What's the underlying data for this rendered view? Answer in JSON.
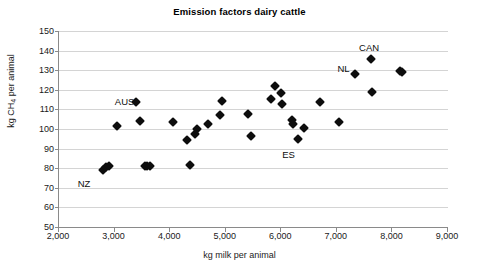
{
  "chart_data": {
    "type": "scatter",
    "title": "Emission factors dairy cattle",
    "xlabel": "kg milk per animal",
    "ylabel": "kg CH4 per animal",
    "ylabel_parts": {
      "prefix": "kg CH",
      "subscript": "4",
      "suffix": " per animal"
    },
    "xlim": [
      2000,
      9000
    ],
    "ylim": [
      50,
      150
    ],
    "xticks": [
      2000,
      3000,
      4000,
      5000,
      6000,
      7000,
      8000,
      9000
    ],
    "xtick_labels": [
      "2,000",
      "3,000",
      "4,000",
      "5,000",
      "6,000",
      "7,000",
      "8,000",
      "9,000"
    ],
    "yticks": [
      50,
      60,
      70,
      80,
      90,
      100,
      110,
      120,
      130,
      140,
      150
    ],
    "ytick_labels": [
      "50",
      "60",
      "70",
      "80",
      "90",
      "100",
      "110",
      "120",
      "130",
      "140",
      "150"
    ],
    "grid": {
      "horizontal": true,
      "vertical": false
    },
    "legend": null,
    "marker": {
      "shape": "diamond",
      "color": "#0d0d0d",
      "size": 7
    },
    "points": [
      {
        "x": 2800,
        "y": 79.3
      },
      {
        "x": 2850,
        "y": 80.5
      },
      {
        "x": 2900,
        "y": 81.3
      },
      {
        "x": 3050,
        "y": 101.3
      },
      {
        "x": 3390,
        "y": 113.6
      },
      {
        "x": 3450,
        "y": 104.1
      },
      {
        "x": 3540,
        "y": 81.3
      },
      {
        "x": 3590,
        "y": 81.3
      },
      {
        "x": 3640,
        "y": 81.3
      },
      {
        "x": 4060,
        "y": 103.4
      },
      {
        "x": 4300,
        "y": 94.2
      },
      {
        "x": 4360,
        "y": 81.4
      },
      {
        "x": 4450,
        "y": 97.2
      },
      {
        "x": 4480,
        "y": 100.2
      },
      {
        "x": 4680,
        "y": 102.7
      },
      {
        "x": 4900,
        "y": 106.9
      },
      {
        "x": 4930,
        "y": 114.4
      },
      {
        "x": 5400,
        "y": 107.6
      },
      {
        "x": 5460,
        "y": 96.2
      },
      {
        "x": 5810,
        "y": 115.1
      },
      {
        "x": 5890,
        "y": 122.0
      },
      {
        "x": 5990,
        "y": 118.5
      },
      {
        "x": 6010,
        "y": 113.0
      },
      {
        "x": 6190,
        "y": 104.5
      },
      {
        "x": 6210,
        "y": 102.8
      },
      {
        "x": 6300,
        "y": 95.0
      },
      {
        "x": 6400,
        "y": 100.4
      },
      {
        "x": 6700,
        "y": 113.9
      },
      {
        "x": 7040,
        "y": 103.6
      },
      {
        "x": 7330,
        "y": 128.1
      },
      {
        "x": 7620,
        "y": 135.8
      },
      {
        "x": 7640,
        "y": 119.1
      },
      {
        "x": 8140,
        "y": 129.4
      },
      {
        "x": 8180,
        "y": 129.0
      }
    ],
    "annotations": [
      {
        "label": "NZ",
        "x": 2450,
        "y": 72.5
      },
      {
        "label": "AUS",
        "x": 3180,
        "y": 114.5
      },
      {
        "label": "ES",
        "x": 6130,
        "y": 87.5
      },
      {
        "label": "NL",
        "x": 7120,
        "y": 131.0
      },
      {
        "label": "CAN",
        "x": 7580,
        "y": 142.0
      }
    ]
  }
}
